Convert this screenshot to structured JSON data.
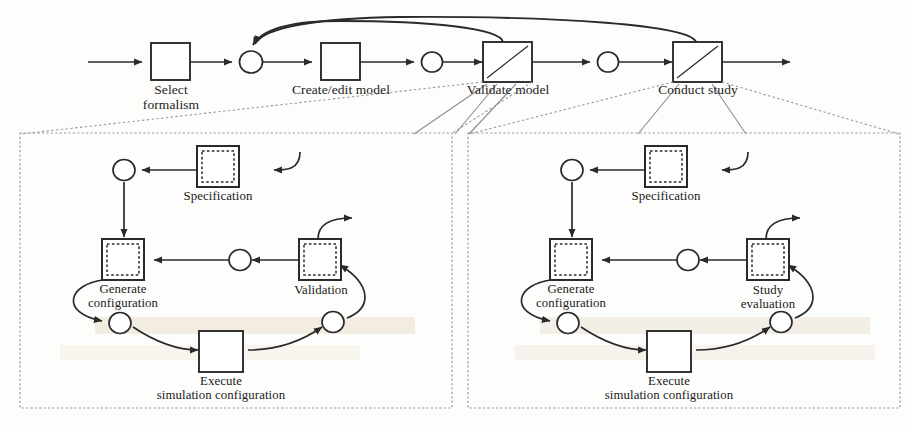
{
  "figure": {
    "type": "process-flow-diagram"
  },
  "top_flow": {
    "name": "simulation-study-main-flow",
    "transitions": [
      {
        "id": "select-formalism",
        "label": "Select\nformalism",
        "x": 170,
        "y": 61,
        "w": 38,
        "h": 37,
        "style": "plain"
      },
      {
        "id": "create-edit-model",
        "label": "Create/edit model",
        "x": 340,
        "y": 61,
        "w": 38,
        "h": 37,
        "style": "plain"
      },
      {
        "id": "validate-model",
        "label": "Validate model",
        "x": 510,
        "y": 61,
        "w": 40,
        "h": 38,
        "style": "subprocess"
      },
      {
        "id": "conduct-study",
        "label": "Conduct study",
        "x": 700,
        "y": 61,
        "w": 40,
        "h": 38,
        "style": "subprocess"
      }
    ],
    "places": [
      {
        "id": "place-after-select",
        "x": 251,
        "y": 62,
        "r": 11
      },
      {
        "id": "place-after-create",
        "x": 432,
        "y": 62,
        "r": 10
      },
      {
        "id": "place-after-validate",
        "x": 608,
        "y": 62,
        "r": 10
      }
    ],
    "feedback_arcs": [
      {
        "id": "feedback-from-validate",
        "from": "validate-model",
        "to": "place-after-select"
      },
      {
        "id": "feedback-from-conduct",
        "from": "conduct-study",
        "to": "place-after-select"
      }
    ]
  },
  "panels": [
    {
      "id": "validate-model-detail",
      "name": "validate-model-subprocess-panel",
      "parent": "validate-model",
      "x": 20,
      "y": 133,
      "w": 432,
      "h": 275,
      "nodes": {
        "specification": {
          "label": "Specification",
          "style": "subprocess"
        },
        "generate_configuration": {
          "label": "Generate\nconfiguration",
          "style": "subprocess"
        },
        "execute_simulation": {
          "label": "Execute\nsimulation configuration",
          "style": "plain"
        },
        "evaluation": {
          "label": "Validation",
          "style": "subprocess"
        }
      }
    },
    {
      "id": "conduct-study-detail",
      "name": "conduct-study-subprocess-panel",
      "parent": "conduct-study",
      "x": 468,
      "y": 133,
      "w": 432,
      "h": 275,
      "nodes": {
        "specification": {
          "label": "Specification",
          "style": "subprocess"
        },
        "generate_configuration": {
          "label": "Generate\nconfiguration",
          "style": "subprocess"
        },
        "execute_simulation": {
          "label": "Execute\nsimulation configuration",
          "style": "plain"
        },
        "evaluation": {
          "label": "Study\nevaluation",
          "style": "subprocess"
        }
      }
    }
  ],
  "colors": {
    "stroke": "#2a2a2a",
    "panel_border": "#9a9a9a",
    "background": "#fdfdfb",
    "watermark": "#efe6d8",
    "text": "#1b1b1b"
  }
}
